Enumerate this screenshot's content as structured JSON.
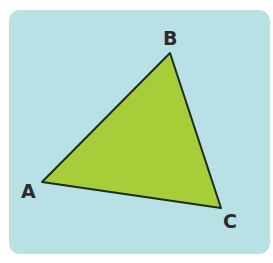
{
  "diagram": {
    "type": "triangle",
    "colors": {
      "background": "#b7e1e5",
      "fill": "#a6ce39",
      "stroke": "#1f2a1f",
      "label": "#2b2b2b"
    },
    "vertices": [
      {
        "label": "A",
        "x": 42,
        "y": 182
      },
      {
        "label": "B",
        "x": 170,
        "y": 53
      },
      {
        "label": "C",
        "x": 221,
        "y": 208
      }
    ]
  }
}
